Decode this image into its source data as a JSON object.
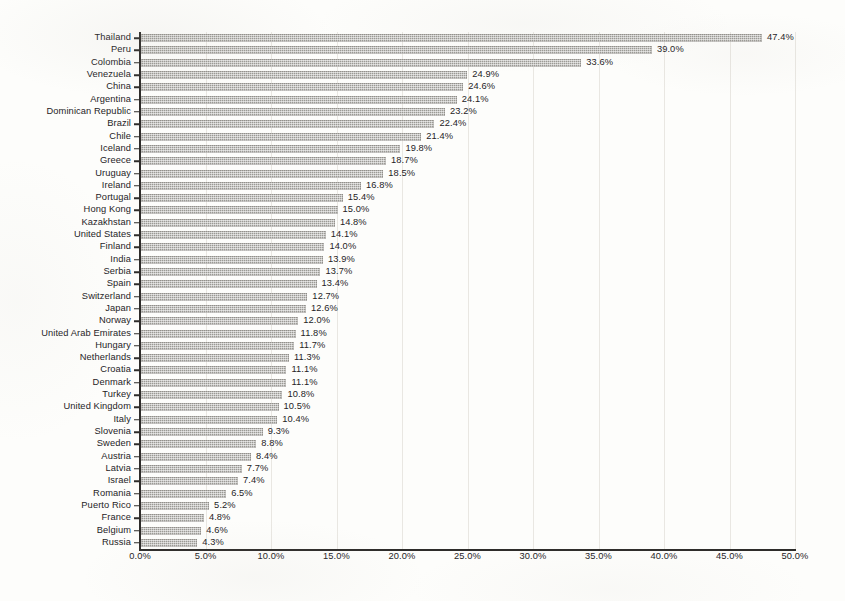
{
  "chart_data": {
    "type": "bar",
    "orientation": "horizontal",
    "title": "",
    "subtitle": "",
    "xlabel": "",
    "ylabel": "",
    "xlim": [
      0,
      50
    ],
    "xticks": [
      "0.0%",
      "5.0%",
      "10.0%",
      "15.0%",
      "20.0%",
      "25.0%",
      "30.0%",
      "35.0%",
      "40.0%",
      "45.0%",
      "50.0%"
    ],
    "xtick_values": [
      0,
      5,
      10,
      15,
      20,
      25,
      30,
      35,
      40,
      45,
      50
    ],
    "grid": "vertical",
    "legend": "none",
    "value_suffix": "%",
    "bar_color": "#9b9a95",
    "axis_color": "#2e2c2a",
    "grid_color": "#e9e7e2",
    "categories": [
      "Thailand",
      "Peru",
      "Colombia",
      "Venezuela",
      "China",
      "Argentina",
      "Dominican Republic",
      "Brazil",
      "Chile",
      "Iceland",
      "Greece",
      "Uruguay",
      "Ireland",
      "Portugal",
      "Hong Kong",
      "Kazakhstan",
      "United States",
      "Finland",
      "India",
      "Serbia",
      "Spain",
      "Switzerland",
      "Japan",
      "Norway",
      "United Arab Emirates",
      "Hungary",
      "Netherlands",
      "Croatia",
      "Denmark",
      "Turkey",
      "United Kingdom",
      "Italy",
      "Slovenia",
      "Sweden",
      "Austria",
      "Latvia",
      "Israel",
      "Romania",
      "Puerto Rico",
      "France",
      "Belgium",
      "Russia"
    ],
    "values": [
      47.4,
      39.0,
      33.6,
      24.9,
      24.6,
      24.1,
      23.2,
      22.4,
      21.4,
      19.8,
      18.7,
      18.5,
      16.8,
      15.4,
      15.0,
      14.8,
      14.1,
      14.0,
      13.9,
      13.7,
      13.4,
      12.7,
      12.6,
      12.0,
      11.8,
      11.7,
      11.3,
      11.1,
      11.1,
      10.8,
      10.5,
      10.4,
      9.3,
      8.8,
      8.4,
      7.7,
      7.4,
      6.5,
      5.2,
      4.8,
      4.6,
      4.3
    ],
    "data_labels": [
      "47.4%",
      "39.0%",
      "33.6%",
      "24.9%",
      "24.6%",
      "24.1%",
      "23.2%",
      "22.4%",
      "21.4%",
      "19.8%",
      "18.7%",
      "18.5%",
      "16.8%",
      "15.4%",
      "15.0%",
      "14.8%",
      "14.1%",
      "14.0%",
      "13.9%",
      "13.7%",
      "13.4%",
      "12.7%",
      "12.6%",
      "12.0%",
      "11.8%",
      "11.7%",
      "11.3%",
      "11.1%",
      "11.1%",
      "10.8%",
      "10.5%",
      "10.4%",
      "9.3%",
      "8.8%",
      "8.4%",
      "7.7%",
      "7.4%",
      "6.5%",
      "5.2%",
      "4.8%",
      "4.6%",
      "4.3%"
    ]
  }
}
